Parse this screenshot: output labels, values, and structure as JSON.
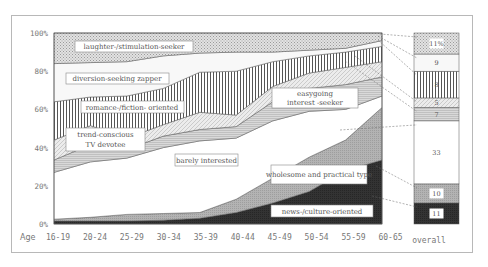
{
  "chart_data": {
    "type": "area",
    "stacked": true,
    "title": "",
    "xlabel": "Age",
    "ylabel": "",
    "ylim": [
      0,
      100
    ],
    "yticks": [
      "0%",
      "20%",
      "40%",
      "60%",
      "80%",
      "100%"
    ],
    "categories": [
      "16-19",
      "20-24",
      "25-29",
      "30-34",
      "35-39",
      "40-44",
      "45-49",
      "50-54",
      "55-59",
      "60-65"
    ],
    "series": [
      {
        "name": "news-/culture-oriented",
        "values": [
          1.5,
          1.5,
          1.5,
          2,
          3,
          6,
          11,
          17,
          28,
          33.5
        ]
      },
      {
        "name": "wholesome and practical type",
        "values": [
          1,
          2,
          3.5,
          3.5,
          3,
          7,
          13,
          18,
          16,
          27.5
        ]
      },
      {
        "name": "barely interested",
        "values": [
          24.5,
          29,
          29.5,
          34.5,
          37.5,
          32,
          30,
          24,
          16,
          6
        ]
      },
      {
        "name": "easygoing interest -seeker",
        "values": [
          6.5,
          9,
          4.5,
          6,
          6,
          6,
          10,
          12,
          13,
          10
        ]
      },
      {
        "name": "trend-conscious TV devotee",
        "values": [
          10.5,
          10,
          6,
          6,
          9,
          6,
          8,
          8,
          9,
          8
        ]
      },
      {
        "name": "romance-/fiction- oriented",
        "values": [
          20,
          15,
          22,
          19,
          21,
          23,
          13,
          9,
          8,
          8
        ]
      },
      {
        "name": "diversion-seeking zapper",
        "values": [
          20,
          18,
          18,
          17,
          10,
          10,
          5,
          3,
          2,
          3
        ]
      },
      {
        "name": "laughter-/stimulation-seeker",
        "values": [
          16,
          15.5,
          15,
          12,
          10.5,
          10,
          10,
          9,
          8,
          4
        ]
      }
    ],
    "overall": {
      "label": "overall",
      "segments": [
        {
          "name": "news-/culture-oriented",
          "value": 11,
          "label": "11"
        },
        {
          "name": "wholesome and practical type",
          "value": 10,
          "label": "10"
        },
        {
          "name": "barely interested",
          "value": 33,
          "label": "33"
        },
        {
          "name": "easygoing interest -seeker",
          "value": 7,
          "label": "7"
        },
        {
          "name": "trend-conscious TV devotee",
          "value": 5,
          "label": "5"
        },
        {
          "name": "romance-/fiction- oriented",
          "value": 14,
          "label": "8"
        },
        {
          "name": "diversion-seeking zapper",
          "value": 9,
          "label": "9"
        },
        {
          "name": "laughter-/stimulation-seeker",
          "value": 11,
          "label": "11%"
        }
      ]
    },
    "annotations": [
      {
        "text": "laughter-/stimulation-seeker",
        "series": "laughter-/stimulation-seeker"
      },
      {
        "text": "diversion-seeking zapper",
        "series": "diversion-seeking zapper"
      },
      {
        "text": "romance-/fiction- oriented",
        "series": "romance-/fiction- oriented"
      },
      {
        "text": "trend-conscious TV devotee",
        "series": "trend-conscious TV devotee"
      },
      {
        "text": "easygoing interest -seeker",
        "series": "easygoing interest -seeker"
      },
      {
        "text": "barely interested",
        "series": "barely interested"
      },
      {
        "text": "wholesome and practical type",
        "series": "wholesome and practical type"
      },
      {
        "text": "news-/culture-oriented",
        "series": "news-/culture-oriented"
      }
    ],
    "legend": "none",
    "grid": false
  },
  "labels": {
    "age": "Age",
    "overall": "overall",
    "laughter": "laughter-/stimulation-seeker",
    "diversion": "diversion-seeking zapper",
    "romance": "romance-/fiction- oriented",
    "trend1": "trend-conscious",
    "trend2": "TV devotee",
    "easy1": "easygoing",
    "easy2": "interest -seeker",
    "barely": "barely interested",
    "wholesome": "wholesome and practical type",
    "news": "news-/culture-oriented"
  },
  "colors": {
    "news": "#2e2e2e",
    "wholesome": "#a9a9a9",
    "barely": "#ffffff",
    "easygoing": "#d4d4d4",
    "trend": "#e6e6e6",
    "romance": "#ffffff",
    "diversion": "#f7f7f7",
    "laughter": "#cfcfcf"
  }
}
